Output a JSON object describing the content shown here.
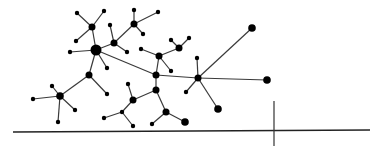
{
  "diagram": {
    "type": "network-graph",
    "background": "#ffffff",
    "node_color": "#000000",
    "edge_color": "#3a3a3a",
    "nodes": [
      {
        "id": "n0",
        "x": 96,
        "y": 50,
        "r": 5.5
      },
      {
        "id": "n1",
        "x": 92,
        "y": 27,
        "r": 3.5
      },
      {
        "id": "n2",
        "x": 77,
        "y": 13,
        "r": 2.2
      },
      {
        "id": "n3",
        "x": 104,
        "y": 11,
        "r": 2.2
      },
      {
        "id": "n4",
        "x": 76,
        "y": 41,
        "r": 2.2
      },
      {
        "id": "n5",
        "x": 70,
        "y": 52,
        "r": 2.2
      },
      {
        "id": "n6",
        "x": 107,
        "y": 68,
        "r": 2.2
      },
      {
        "id": "n7",
        "x": 89,
        "y": 75,
        "r": 3.5
      },
      {
        "id": "n8",
        "x": 114,
        "y": 43,
        "r": 3.5
      },
      {
        "id": "n9",
        "x": 110,
        "y": 25,
        "r": 2.2
      },
      {
        "id": "n10",
        "x": 127,
        "y": 52,
        "r": 2.2
      },
      {
        "id": "n11",
        "x": 134,
        "y": 24,
        "r": 3.5
      },
      {
        "id": "n12",
        "x": 134,
        "y": 10,
        "r": 2.2
      },
      {
        "id": "n13",
        "x": 158,
        "y": 12,
        "r": 2.2
      },
      {
        "id": "n14",
        "x": 143,
        "y": 34,
        "r": 2.2
      },
      {
        "id": "n15",
        "x": 156,
        "y": 75,
        "r": 3.5
      },
      {
        "id": "n16",
        "x": 159,
        "y": 56,
        "r": 3.5
      },
      {
        "id": "n17",
        "x": 141,
        "y": 49,
        "r": 2.2
      },
      {
        "id": "n18",
        "x": 171,
        "y": 71,
        "r": 2.2
      },
      {
        "id": "n19",
        "x": 179,
        "y": 48,
        "r": 3.5
      },
      {
        "id": "n20",
        "x": 171,
        "y": 40,
        "r": 2.2
      },
      {
        "id": "n21",
        "x": 189,
        "y": 38,
        "r": 2.2
      },
      {
        "id": "n22",
        "x": 198,
        "y": 78,
        "r": 3.5
      },
      {
        "id": "n23",
        "x": 252,
        "y": 28,
        "r": 3.8
      },
      {
        "id": "n24",
        "x": 267,
        "y": 80,
        "r": 3.8
      },
      {
        "id": "n25",
        "x": 197,
        "y": 58,
        "r": 2.2
      },
      {
        "id": "n26",
        "x": 186,
        "y": 92,
        "r": 2.2
      },
      {
        "id": "n27",
        "x": 218,
        "y": 109,
        "r": 3.8
      },
      {
        "id": "n28",
        "x": 60,
        "y": 96,
        "r": 3.8
      },
      {
        "id": "n29",
        "x": 33,
        "y": 99,
        "r": 2.2
      },
      {
        "id": "n30",
        "x": 52,
        "y": 86,
        "r": 2.2
      },
      {
        "id": "n31",
        "x": 58,
        "y": 122,
        "r": 2.2
      },
      {
        "id": "n32",
        "x": 75,
        "y": 110,
        "r": 2.2
      },
      {
        "id": "n33",
        "x": 107,
        "y": 94,
        "r": 2.2
      },
      {
        "id": "n34",
        "x": 156,
        "y": 90,
        "r": 3.5
      },
      {
        "id": "n35",
        "x": 133,
        "y": 100,
        "r": 3.5
      },
      {
        "id": "n36",
        "x": 128,
        "y": 84,
        "r": 2.2
      },
      {
        "id": "n37",
        "x": 122,
        "y": 112,
        "r": 2.2
      },
      {
        "id": "n38",
        "x": 104,
        "y": 118,
        "r": 2.2
      },
      {
        "id": "n39",
        "x": 133,
        "y": 126,
        "r": 2.2
      },
      {
        "id": "n40",
        "x": 166,
        "y": 112,
        "r": 3.5
      },
      {
        "id": "n41",
        "x": 152,
        "y": 124,
        "r": 2.2
      },
      {
        "id": "n42",
        "x": 185,
        "y": 122,
        "r": 3.8
      }
    ],
    "edges": [
      [
        "n0",
        "n1"
      ],
      [
        "n1",
        "n2"
      ],
      [
        "n1",
        "n3"
      ],
      [
        "n1",
        "n4"
      ],
      [
        "n0",
        "n5"
      ],
      [
        "n0",
        "n6"
      ],
      [
        "n0",
        "n7"
      ],
      [
        "n0",
        "n8"
      ],
      [
        "n8",
        "n9"
      ],
      [
        "n8",
        "n10"
      ],
      [
        "n8",
        "n11"
      ],
      [
        "n11",
        "n12"
      ],
      [
        "n11",
        "n13"
      ],
      [
        "n11",
        "n14"
      ],
      [
        "n0",
        "n15"
      ],
      [
        "n15",
        "n16"
      ],
      [
        "n16",
        "n17"
      ],
      [
        "n16",
        "n18"
      ],
      [
        "n16",
        "n19"
      ],
      [
        "n19",
        "n20"
      ],
      [
        "n19",
        "n21"
      ],
      [
        "n15",
        "n22"
      ],
      [
        "n22",
        "n23"
      ],
      [
        "n22",
        "n24"
      ],
      [
        "n22",
        "n25"
      ],
      [
        "n22",
        "n26"
      ],
      [
        "n22",
        "n27"
      ],
      [
        "n7",
        "n28"
      ],
      [
        "n28",
        "n29"
      ],
      [
        "n28",
        "n30"
      ],
      [
        "n28",
        "n31"
      ],
      [
        "n28",
        "n32"
      ],
      [
        "n7",
        "n33"
      ],
      [
        "n15",
        "n34"
      ],
      [
        "n34",
        "n35"
      ],
      [
        "n35",
        "n36"
      ],
      [
        "n35",
        "n37"
      ],
      [
        "n37",
        "n38"
      ],
      [
        "n37",
        "n39"
      ],
      [
        "n34",
        "n40"
      ],
      [
        "n40",
        "n41"
      ],
      [
        "n40",
        "n42"
      ]
    ],
    "axis": {
      "horizontal": {
        "x1": 13,
        "y1": 132,
        "x2": 370,
        "y2": 130
      },
      "vertical_tick": {
        "x1": 274,
        "y1": 101,
        "x2": 274,
        "y2": 146
      }
    }
  }
}
